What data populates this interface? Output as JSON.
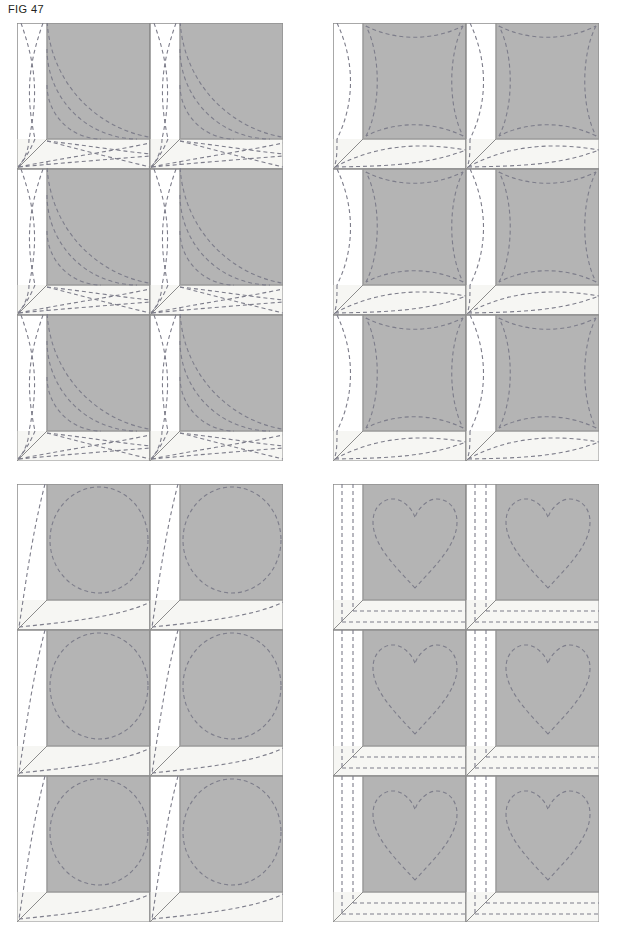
{
  "figure": {
    "label": "FIG 47",
    "type": "quilting-pattern-diagram",
    "canvas": {
      "width": 622,
      "height": 936,
      "background": "#ffffff"
    }
  },
  "colors": {
    "background": "#ffffff",
    "patch_gray": "#b4b4b4",
    "patch_gray_edge": "#9a9a9a",
    "strip_white": "#ffffff",
    "strip_cream": "#f6f6f3",
    "outline": "#8c8c8c",
    "stitch_dash": "#7d7d8a",
    "label_text": "#231f20"
  },
  "layout": {
    "panel_count": 4,
    "panel_columns": 2,
    "panel_rows": 2,
    "blocks_per_panel_columns": 2,
    "blocks_per_panel_rows": 3,
    "block_width_px": 133,
    "block_height_px": 146,
    "panel_width_px": 266,
    "panel_height_px": 438,
    "strip_left_width_px": 30,
    "strip_bottom_height_px": 30
  },
  "panels": [
    {
      "id": "panel-top-left",
      "position": "top-left",
      "origin": {
        "x": 17,
        "y": 23
      },
      "quilting_motif": "concentric-quarter-arcs",
      "motif_description": "Nested quarter-circle arcs radiating from the lower-left corner across the gray square",
      "arc_count": 3,
      "side_strip_motif": "crossing-double-curve-x",
      "bottom_strip_motif": "crossing-arcs-lens"
    },
    {
      "id": "panel-top-right",
      "position": "top-right",
      "origin": {
        "x": 333,
        "y": 23
      },
      "quilting_motif": "concave-square-outline",
      "motif_description": "Square outline with all four edges bowed inward, stitched just inside the gray patch",
      "arc_count": 1,
      "side_strip_motif": "single-inward-curve",
      "bottom_strip_motif": "lens-ellipse-arc"
    },
    {
      "id": "panel-bottom-left",
      "position": "bottom-left",
      "origin": {
        "x": 17,
        "y": 484
      },
      "quilting_motif": "circle",
      "motif_description": "A single large dashed circle filling the gray square",
      "arc_count": 1,
      "side_strip_motif": "single-sweeping-curve",
      "bottom_strip_motif": "single-sweeping-curve"
    },
    {
      "id": "panel-bottom-right",
      "position": "bottom-right",
      "origin": {
        "x": 333,
        "y": 484
      },
      "quilting_motif": "heart",
      "motif_description": "A dashed heart outline centred in the gray square",
      "arc_count": 1,
      "side_strip_motif": "two-parallel-straight-lines",
      "bottom_strip_motif": "two-parallel-straight-lines"
    }
  ],
  "stitch_style": {
    "stroke_width": 1.1,
    "dash_array": "4 3",
    "color": "#7d7d8a"
  }
}
